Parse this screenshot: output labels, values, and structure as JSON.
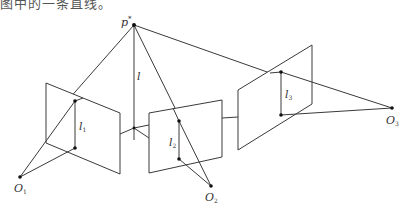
{
  "caption": "图中的一条直线。",
  "diagram": {
    "colors": {
      "line": "#3a3a3a",
      "point": "#111111",
      "text": "#333333"
    },
    "apex": {
      "label": "p",
      "sup": "*",
      "x": 134,
      "y": 25
    },
    "vertical_line": {
      "label": "l",
      "x": 134,
      "y1": 25,
      "y2": 140
    },
    "planes": [
      {
        "name": "left-plane",
        "pts": "46,83 120,113 120,174 46,143"
      },
      {
        "name": "middle-plane",
        "pts": "149,113 222,100 222,157 149,173"
      },
      {
        "name": "right-plane",
        "pts": "238,90 312,45 312,104 238,150"
      }
    ],
    "image_lines": [
      {
        "label": "l",
        "sub": "1",
        "x": 75,
        "y1": 101,
        "y2": 148,
        "lx": 80,
        "ly": 128
      },
      {
        "label": "l",
        "sub": "2",
        "x": 179,
        "y1": 121,
        "y2": 159,
        "lx": 170,
        "ly": 145
      },
      {
        "label": "l",
        "sub": "3",
        "x": 281,
        "y1": 72,
        "y2": 115,
        "lx": 286,
        "ly": 97
      }
    ],
    "centers": [
      {
        "label": "O",
        "sub": "1",
        "x": 20,
        "y": 177,
        "lx": 16,
        "ly": 193
      },
      {
        "label": "O",
        "sub": "2",
        "x": 211,
        "y": 186,
        "lx": 205,
        "ly": 201
      },
      {
        "label": "O",
        "sub": "3",
        "x": 392,
        "y": 108,
        "lx": 387,
        "ly": 124
      }
    ]
  }
}
